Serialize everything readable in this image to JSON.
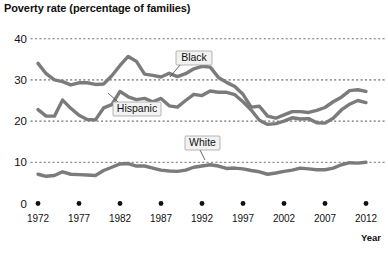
{
  "chart_data": {
    "type": "line",
    "title": "Poverty rate (percentage of families)",
    "xlabel": "Year",
    "ylabel": "",
    "xlim": [
      1972,
      2012
    ],
    "ylim": [
      0,
      40
    ],
    "grid": true,
    "legend_position": "inline-callouts",
    "y_ticks": [
      "40",
      "30",
      "20",
      "10",
      "0"
    ],
    "y_tick_values": [
      40,
      30,
      20,
      10,
      0
    ],
    "x_ticks": [
      "1972",
      "1977",
      "1982",
      "1987",
      "1992",
      "1997",
      "2002",
      "2007",
      "2012"
    ],
    "x_tick_values": [
      1972,
      1977,
      1982,
      1987,
      1992,
      1997,
      2002,
      2007,
      2012
    ],
    "annotations": [
      "Black",
      "Hispanic",
      "White"
    ],
    "line_color": "#7b7b7b",
    "grid_color": "#6e6e6e",
    "x": [
      1972,
      1973,
      1974,
      1975,
      1976,
      1977,
      1978,
      1979,
      1980,
      1981,
      1982,
      1983,
      1984,
      1985,
      1986,
      1987,
      1988,
      1989,
      1990,
      1991,
      1992,
      1993,
      1994,
      1995,
      1996,
      1997,
      1998,
      1999,
      2000,
      2001,
      2002,
      2003,
      2004,
      2005,
      2006,
      2007,
      2008,
      2009,
      2010,
      2011,
      2012
    ],
    "series": [
      {
        "name": "Black",
        "label": "Black",
        "values": [
          34.0,
          31.5,
          30.0,
          29.6,
          28.8,
          29.3,
          29.3,
          28.9,
          29.0,
          31.0,
          33.5,
          35.7,
          34.5,
          31.4,
          31.1,
          30.7,
          31.6,
          30.8,
          31.5,
          32.7,
          33.3,
          33.1,
          30.6,
          29.4,
          28.4,
          26.5,
          23.4,
          23.6,
          21.2,
          20.7,
          21.5,
          22.3,
          22.3,
          22.1,
          22.6,
          23.3,
          24.7,
          25.8,
          27.4,
          27.6,
          27.2
        ]
      },
      {
        "name": "Hispanic",
        "label": "Hispanic",
        "values": [
          22.8,
          21.2,
          21.2,
          25.1,
          23.1,
          21.4,
          20.4,
          20.3,
          23.2,
          24.0,
          27.2,
          25.9,
          25.2,
          25.5,
          24.7,
          25.5,
          23.7,
          23.4,
          25.0,
          26.5,
          26.2,
          27.3,
          27.0,
          27.0,
          26.4,
          24.7,
          22.7,
          20.2,
          19.2,
          19.4,
          20.0,
          20.8,
          20.5,
          20.6,
          19.6,
          19.5,
          20.7,
          22.7,
          24.1,
          25.0,
          24.5
        ]
      },
      {
        "name": "White",
        "label": "White",
        "values": [
          7.1,
          6.6,
          6.8,
          7.7,
          7.1,
          7.0,
          6.9,
          6.8,
          8.0,
          8.8,
          9.6,
          9.7,
          9.1,
          9.1,
          8.6,
          8.1,
          7.9,
          7.8,
          8.1,
          8.8,
          9.1,
          9.4,
          9.1,
          8.5,
          8.6,
          8.4,
          8.0,
          7.7,
          7.1,
          7.4,
          7.8,
          8.1,
          8.6,
          8.4,
          8.2,
          8.2,
          8.6,
          9.4,
          9.9,
          9.8,
          10.0
        ]
      }
    ]
  },
  "callouts": {
    "black": "Black",
    "hispanic": "Hispanic",
    "white": "White"
  }
}
